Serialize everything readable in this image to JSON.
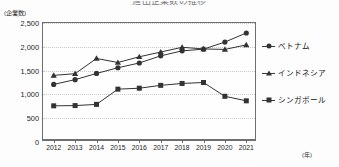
{
  "chart_data": {
    "type": "line",
    "title": "進出企業数の推移",
    "xlabel": "(年)",
    "ylabel": "(企業数)",
    "x": [
      "2012",
      "2013",
      "2014",
      "2015",
      "2016",
      "2017",
      "2018",
      "2019",
      "2020",
      "2021"
    ],
    "ylim": [
      0,
      2500
    ],
    "yticks": [
      0,
      500,
      1000,
      1500,
      2000,
      2500
    ],
    "ytick_labels": [
      "0",
      "500",
      "1,000",
      "1,500",
      "2,000",
      "2,500"
    ],
    "grid": true,
    "legend_position": "right",
    "series": [
      {
        "name": "ベトナム",
        "marker": "circle",
        "values": [
          1210,
          1310,
          1440,
          1560,
          1660,
          1810,
          1915,
          1950,
          2100,
          2290
        ]
      },
      {
        "name": "インドネシア",
        "marker": "triangle",
        "values": [
          1400,
          1435,
          1755,
          1670,
          1790,
          1890,
          1990,
          1955,
          1945,
          2040
        ]
      },
      {
        "name": "シンガポール",
        "marker": "square",
        "values": [
          760,
          765,
          790,
          1110,
          1130,
          1190,
          1230,
          1250,
          960,
          865
        ]
      }
    ]
  },
  "colors": {
    "series": "#333333",
    "axis": "#6f6f6f",
    "grid": "#c9c9c9",
    "background": "#fdfdfd"
  }
}
